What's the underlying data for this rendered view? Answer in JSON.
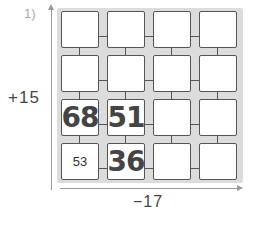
{
  "problem": {
    "number": "1)"
  },
  "axes": {
    "row_operation": "+15",
    "column_operation": "−17"
  },
  "grid": {
    "rows": 4,
    "cols": 4,
    "cells": [
      [
        "",
        "",
        "",
        ""
      ],
      [
        "",
        "",
        "",
        ""
      ],
      [
        "68",
        "51",
        "",
        ""
      ],
      [
        "53",
        "36",
        "",
        ""
      ]
    ],
    "given_cell": {
      "row": 3,
      "col": 0,
      "value": "53"
    },
    "handwritten_answers": [
      {
        "row": 2,
        "col": 0,
        "value": "68"
      },
      {
        "row": 2,
        "col": 1,
        "value": "51"
      },
      {
        "row": 3,
        "col": 1,
        "value": "36"
      }
    ]
  },
  "colors": {
    "grid_background": "#dcdcdc",
    "cell_border": "#555555",
    "arrow": "#999999"
  }
}
